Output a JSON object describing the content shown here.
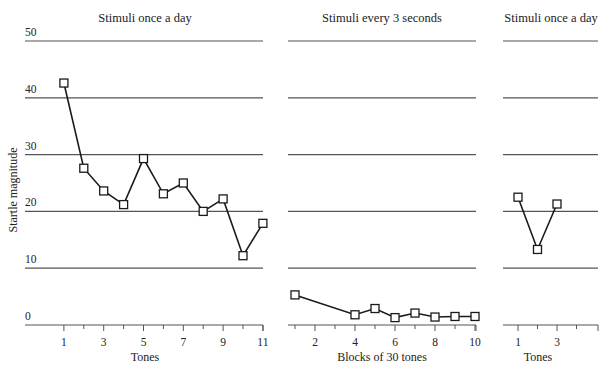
{
  "chart_data": [
    {
      "type": "line",
      "title": "Stimuli once a day",
      "xlabel": "Tones",
      "ylabel": "Startle magnitude",
      "x": [
        1,
        2,
        3,
        4,
        5,
        6,
        7,
        8,
        9,
        10,
        11
      ],
      "x_ticks": [
        1,
        3,
        5,
        7,
        9,
        11
      ],
      "values": [
        42.6,
        27.6,
        23.6,
        21.2,
        29.3,
        23.1,
        25.0,
        20.0,
        22.2,
        12.2,
        17.9
      ],
      "ylim": [
        0,
        50
      ],
      "y_ticks": [
        0,
        10,
        20,
        30,
        40,
        50
      ],
      "grid": true,
      "marker": "open-square"
    },
    {
      "type": "line",
      "title": "Stimuli every 3 seconds",
      "xlabel": "Blocks of 30 tones",
      "x": [
        1,
        4,
        5,
        6,
        7,
        8,
        9,
        10
      ],
      "x_ticks": [
        2,
        4,
        6,
        8,
        10
      ],
      "values": [
        5.3,
        1.8,
        2.9,
        1.3,
        2.1,
        1.4,
        1.5,
        1.5
      ],
      "ylim": [
        0,
        50
      ],
      "grid": true,
      "marker": "open-square"
    },
    {
      "type": "line",
      "title": "Stimuli once a day",
      "xlabel": "Tones",
      "x": [
        1,
        2,
        3
      ],
      "x_ticks": [
        1,
        3
      ],
      "values": [
        22.5,
        13.3,
        21.3
      ],
      "ylim": [
        0,
        50
      ],
      "grid": true,
      "marker": "open-square"
    }
  ],
  "labels": {
    "ylabel": "Startle magnitude",
    "y_tick_labels": [
      "0",
      "10",
      "20",
      "30",
      "40",
      "50"
    ]
  },
  "colors": {
    "line": "#1a1a1a",
    "grid": "#555555",
    "text": "#222222"
  }
}
